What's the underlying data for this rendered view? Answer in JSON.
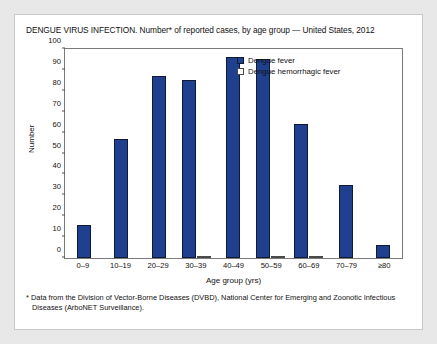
{
  "title": "DENGUE VIRUS INFECTION. Number* of reported cases, by age group — United States, 2012",
  "footnote": {
    "line1": "* Data from the Division of Vector-Borne Diseases (DVBD), National Center for Emerging and Zoonotic Infectious",
    "line2": "Diseases (ArboNET Surveillance)."
  },
  "colors": {
    "dengue_fever": "#1f3f8f",
    "dengue_hemorrhagic_fever": "#ffffff",
    "outline": "#111a33",
    "page_background": "#e8e8e8",
    "card_background": "#ffffff"
  },
  "chart_data": {
    "type": "bar",
    "title": "DENGUE VIRUS INFECTION. Number* of reported cases, by age group — United States, 2012",
    "xlabel": "Age group (yrs)",
    "ylabel": "Number",
    "ylim": [
      0,
      100
    ],
    "yticks": [
      0,
      10,
      20,
      30,
      40,
      50,
      60,
      70,
      80,
      90,
      100
    ],
    "grid": false,
    "legend_position": "inside-top-right",
    "categories": [
      "0–9",
      "10–19",
      "20–29",
      "30–39",
      "40–49",
      "50–59",
      "60–69",
      "70–79",
      "≥80"
    ],
    "series": [
      {
        "name": "Dengue fever",
        "values": [
          16,
          57,
          87,
          85,
          96,
          95,
          64,
          35,
          6
        ]
      },
      {
        "name": "Dengue hemorrhagic fever",
        "values": [
          0,
          0,
          0,
          1,
          0,
          1,
          1,
          0,
          0
        ]
      }
    ]
  }
}
